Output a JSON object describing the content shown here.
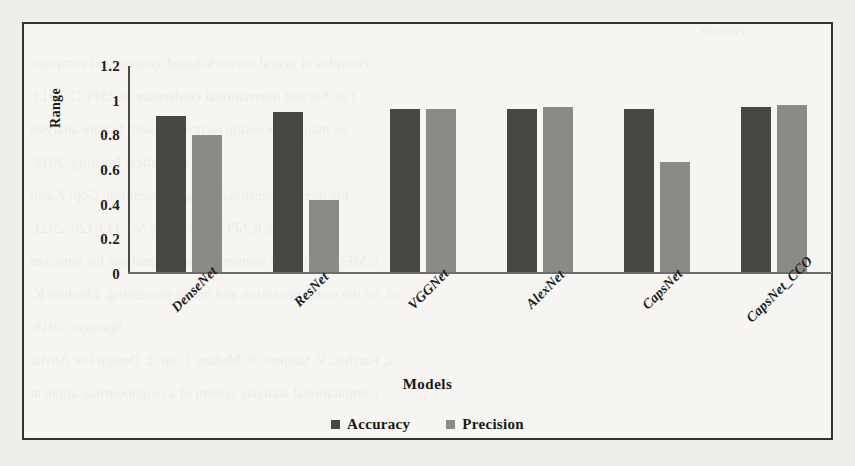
{
  "chart_data": {
    "type": "bar",
    "title": "",
    "xlabel": "Models",
    "ylabel": "Range",
    "categories": [
      "DenseNet",
      "ResNet",
      "VGGNet",
      "AlexNet",
      "CapsNet",
      "CapsNet_CCO"
    ],
    "series": [
      {
        "name": "Accuracy",
        "color": "#474744",
        "values": [
          0.91,
          0.93,
          0.95,
          0.95,
          0.95,
          0.96
        ]
      },
      {
        "name": "Precision",
        "color": "#8a8a86",
        "values": [
          0.8,
          0.42,
          0.95,
          0.96,
          0.64,
          0.97
        ]
      }
    ],
    "ylim": [
      0,
      1.2
    ],
    "ytick_labels": [
      "1.2",
      "1",
      "0.8",
      "0.6",
      "0.4",
      "0.2",
      "0"
    ],
    "ytick_values": [
      1.2,
      1,
      0.8,
      0.6,
      0.4,
      0.2,
      0
    ],
    "grid": false,
    "legend_position": "bottom"
  },
  "legend": {
    "items": [
      {
        "label": "Accuracy",
        "marker": "square-dark"
      },
      {
        "label": "Precision",
        "marker": "square-gray"
      }
    ]
  },
  "background_text": {
    "lines": [
      "erences",
      "rinciples of neural network-based systems and computer",
      "t al. Second international conference on ISPCC, 2013.",
      "ve image processing techniques with feature analysis",
      "nces in Medical Imaging. 2018.",
      "the three-dimensional image recognition. Gopi Kasin",
      "ring ICSPC 2021. Page No. 113-120, 2021.",
      "t, MEC intelligent segmentation and analysis for intracran",
      "nt, on the computer vision and image processing. Ebrahim K.",
      "Springer, 2019.",
      "s, Karthik, V. Sanjeev, S. Mohan. Conf. I: Design For Artific",
      "computational analysis system of a neighbouring, applicat"
    ]
  }
}
